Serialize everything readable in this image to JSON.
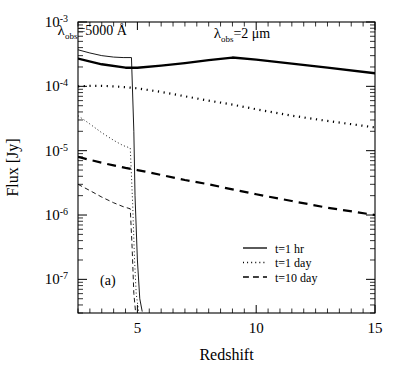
{
  "chart_data": {
    "type": "line",
    "title": "",
    "panel_label": "(a)",
    "xlabel": "Redshift",
    "ylabel": "Flux [Jy]",
    "xlim": [
      2.5,
      15
    ],
    "ylim": [
      3e-08,
      0.001
    ],
    "xscale": "linear",
    "yscale": "log",
    "grid": false,
    "x_major_ticks": [
      5,
      10,
      15
    ],
    "x_major_tick_labels": [
      "5",
      "10",
      "15"
    ],
    "x_minor_tick_step": 0.5,
    "y_major_ticks": [
      0.001,
      0.0001,
      1e-05,
      1e-06,
      1e-07
    ],
    "y_major_tick_labels": [
      "10^-3",
      "10^-4",
      "10^-5",
      "10^-6",
      "10^-7"
    ],
    "y_tick_mantissa": "10",
    "y_tick_exponents": [
      "-3",
      "-4",
      "-5",
      "-6",
      "-7"
    ],
    "ticks_direction": "in",
    "legend": {
      "position": "lower right",
      "entries": [
        {
          "label": "t=1  hr",
          "style": "solid",
          "series_group": "t=1 hr"
        },
        {
          "label": "t=1  day",
          "style": "dotted",
          "series_group": "t=1 day"
        },
        {
          "label": "t=10  day",
          "style": "dashed",
          "series_group": "t=10 day"
        }
      ]
    },
    "annotations": [
      {
        "name": "lambda-5000-label",
        "lam": "λ",
        "sub": "obs",
        "rest": "=5000  Å",
        "x_data": 3.1,
        "y_data": 0.00063,
        "describes": "thin curves (observed wavelength 5000 Angstrom)"
      },
      {
        "name": "lambda-2um-label",
        "lam": "λ",
        "sub": "obs",
        "rest": "=2  μm",
        "x_data": 9.4,
        "y_data": 0.00056,
        "describes": "thick curves (observed wavelength 2 micron)"
      }
    ],
    "series": [
      {
        "name": "5000A, t=1 hr",
        "group": "5000 A",
        "style": "solid",
        "linewidth": 0.9,
        "color": "#000000",
        "x": [
          2.5,
          3.0,
          3.5,
          4.0,
          4.4,
          4.75,
          4.85,
          4.9,
          5.0,
          5.1,
          5.2
        ],
        "y": [
          0.00037,
          0.00033,
          0.0003,
          0.000285,
          0.00028,
          0.00028,
          2e-05,
          2e-06,
          2e-07,
          5e-08,
          3.2e-08
        ]
      },
      {
        "name": "5000A, t=1 day",
        "group": "5000 A",
        "style": "dotted",
        "linewidth": 0.9,
        "color": "#000000",
        "x": [
          2.5,
          3.0,
          3.5,
          4.0,
          4.4,
          4.7,
          4.8,
          4.88,
          4.95,
          5.05
        ],
        "y": [
          3.5e-05,
          2.6e-05,
          1.9e-05,
          1.45e-05,
          1.2e-05,
          1.1e-05,
          1.5e-06,
          2e-07,
          6e-08,
          3.2e-08
        ]
      },
      {
        "name": "5000A, t=10 day",
        "group": "5000 A",
        "style": "dashed",
        "linewidth": 0.9,
        "color": "#000000",
        "x": [
          2.5,
          3.0,
          3.5,
          4.0,
          4.4,
          4.7,
          4.78,
          4.85,
          4.92
        ],
        "y": [
          3e-06,
          2.4e-06,
          1.9e-06,
          1.55e-06,
          1.35e-06,
          1.25e-06,
          3e-07,
          6e-08,
          3.2e-08
        ]
      },
      {
        "name": "2um, t=1 hr",
        "group": "2 micron",
        "style": "solid",
        "linewidth": 2.4,
        "color": "#000000",
        "x": [
          2.5,
          3.5,
          4.5,
          5.0,
          6.0,
          7.0,
          8.0,
          9.0,
          10.0,
          11.5,
          13.0,
          15.0
        ],
        "y": [
          0.00027,
          0.00022,
          0.000195,
          0.000195,
          0.00021,
          0.00023,
          0.000255,
          0.00028,
          0.00026,
          0.000225,
          0.000195,
          0.00016
        ]
      },
      {
        "name": "2um, t=1 day",
        "group": "2 micron",
        "style": "dotted",
        "linewidth": 2.2,
        "color": "#000000",
        "x": [
          2.5,
          3.0,
          3.5,
          4.0,
          4.5,
          5.0,
          6.0,
          7.0,
          8.0,
          9.0,
          10.0,
          11.5,
          13.0,
          15.0
        ],
        "y": [
          0.0001,
          0.000102,
          0.000102,
          0.0001,
          9.7e-05,
          9.3e-05,
          8.2e-05,
          7e-05,
          6e-05,
          5.2e-05,
          4.4e-05,
          3.5e-05,
          2.9e-05,
          2.3e-05
        ]
      },
      {
        "name": "2um, t=10 day",
        "group": "2 micron",
        "style": "dashed",
        "linewidth": 2.2,
        "color": "#000000",
        "x": [
          2.5,
          3.0,
          3.5,
          4.0,
          4.5,
          5.0,
          6.0,
          7.0,
          8.0,
          9.0,
          10.0,
          11.5,
          13.0,
          15.0
        ],
        "y": [
          8e-06,
          7.2e-06,
          6.5e-06,
          5.9e-06,
          5.4e-06,
          5e-06,
          4.2e-06,
          3.5e-06,
          3e-06,
          2.5e-06,
          2.1e-06,
          1.65e-06,
          1.3e-06,
          1e-06
        ]
      }
    ]
  },
  "axes_geometry": {
    "plot_left_px": 78,
    "plot_right_px": 375,
    "plot_top_px": 22,
    "plot_bottom_px": 313
  }
}
